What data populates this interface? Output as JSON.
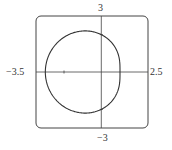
{
  "chart_data": {
    "type": "line",
    "title": "",
    "xlabel": "",
    "ylabel": "",
    "xlim": [
      -3.5,
      2.5
    ],
    "ylim": [
      -3,
      3
    ],
    "tick_labels": {
      "x_min": "−3.5",
      "x_max": "2.5",
      "y_max": "3",
      "y_min": "−3"
    },
    "grid": false,
    "points": [
      {
        "x": -3,
        "y": 0
      },
      {
        "x": 0,
        "y": 2
      },
      {
        "x": 1,
        "y": 0
      },
      {
        "x": 0,
        "y": -2
      }
    ],
    "series": [
      {
        "name": "r = 2 - cos(theta)",
        "color": "#333333"
      }
    ]
  }
}
